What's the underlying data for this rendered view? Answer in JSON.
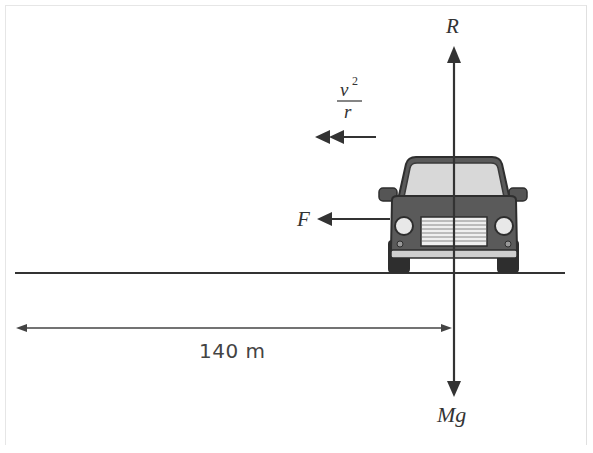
{
  "diagram": {
    "type": "free-body-diagram",
    "forces": {
      "normal_reaction": {
        "label": "R",
        "direction": "up"
      },
      "weight": {
        "label": "Mg",
        "direction": "down"
      },
      "friction": {
        "label": "F",
        "direction": "left"
      },
      "centripetal_acceleration": {
        "numerator": "v",
        "exponent": "2",
        "denominator": "r",
        "direction": "left",
        "arrow": "double-headed"
      }
    },
    "distance": {
      "label": "140 m",
      "meaning": "radius to centre of circular path"
    },
    "colors": {
      "line": "#333333",
      "car_body": "#5a5a5a",
      "car_dark": "#2e2e2e",
      "glass": "#d8d8d8"
    }
  }
}
